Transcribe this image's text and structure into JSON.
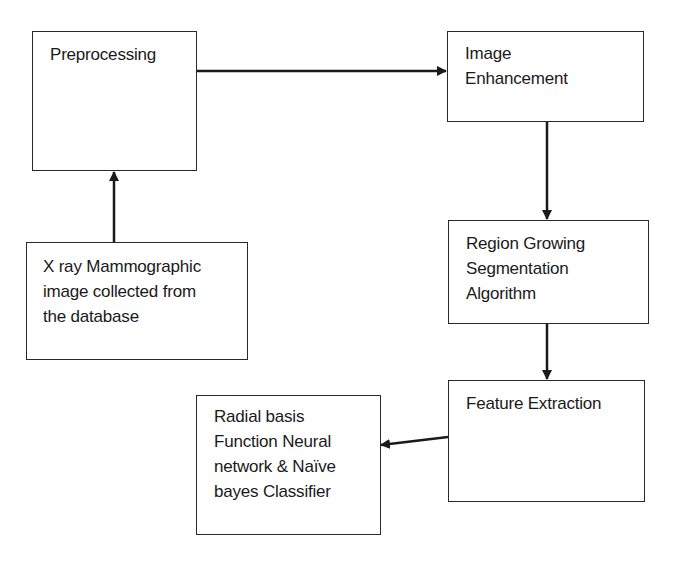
{
  "diagram": {
    "type": "flowchart",
    "nodes": [
      {
        "id": "xray",
        "lines": [
          "X ray Mammographic",
          "image collected from",
          "the database"
        ]
      },
      {
        "id": "preprocessing",
        "lines": [
          "Preprocessing"
        ]
      },
      {
        "id": "enhancement",
        "lines": [
          "Image",
          "Enhancement"
        ]
      },
      {
        "id": "segmentation",
        "lines": [
          "Region Growing",
          "Segmentation",
          "Algorithm"
        ]
      },
      {
        "id": "features",
        "lines": [
          "Feature Extraction"
        ]
      },
      {
        "id": "classifier",
        "lines": [
          "Radial basis",
          "Function Neural",
          "network & Naïve",
          "bayes Classifier"
        ]
      }
    ],
    "edges": [
      {
        "from": "xray",
        "to": "preprocessing"
      },
      {
        "from": "preprocessing",
        "to": "enhancement"
      },
      {
        "from": "enhancement",
        "to": "segmentation"
      },
      {
        "from": "segmentation",
        "to": "features"
      },
      {
        "from": "features",
        "to": "classifier"
      }
    ],
    "colors": {
      "stroke": "#1a1a1a",
      "background": "#ffffff",
      "text": "#1a1a1a"
    }
  }
}
